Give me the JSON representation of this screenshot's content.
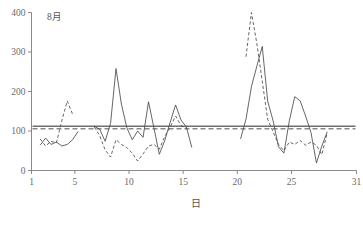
{
  "chart_data": {
    "type": "line",
    "title": "8月",
    "xlabel": "日",
    "ylabel": "",
    "xlim": [
      1,
      31
    ],
    "ylim": [
      0,
      400
    ],
    "xticks": [
      1,
      5,
      10,
      15,
      20,
      25,
      31
    ],
    "xticklabels": [
      "1",
      "5",
      "10",
      "15",
      "20",
      "25",
      "31"
    ],
    "yticks": [
      0,
      100,
      200,
      300,
      400
    ],
    "yticklabels": [
      "0",
      "100",
      "200",
      "300",
      "400"
    ],
    "grid": false,
    "legend": "none",
    "reference_lines": [
      {
        "name": "solid-reference",
        "value": 112,
        "style": "solid"
      },
      {
        "name": "dashed-reference",
        "value": 106,
        "style": "dashed"
      }
    ],
    "series": [
      {
        "name": "solid-series",
        "style": "solid",
        "segments": [
          {
            "x": [
              1.8,
              2.3,
              2.8,
              3.3,
              3.8,
              4.3,
              4.8,
              5.3
            ],
            "y": [
              64,
              82,
              66,
              72,
              62,
              66,
              78,
              99
            ]
          },
          {
            "x": [
              6.8,
              7.3,
              7.8,
              8.3,
              8.8,
              9.3,
              9.8,
              10.3,
              10.8,
              11.3,
              11.8,
              12.3,
              12.8,
              13.3,
              13.8,
              14.3,
              14.8,
              15.3,
              15.8
            ],
            "y": [
              112,
              104,
              74,
              120,
              258,
              168,
              108,
              78,
              100,
              84,
              174,
              108,
              41,
              76,
              122,
              166,
              128,
              110,
              58
            ]
          },
          {
            "x": [
              20.3,
              20.8,
              21.3,
              21.8,
              22.3,
              22.8,
              23.3,
              23.8,
              24.3,
              24.8,
              25.3,
              25.8,
              26.3,
              26.8,
              27.3,
              27.8,
              28.3
            ],
            "y": [
              80,
              130,
              212,
              264,
              314,
              176,
              126,
              60,
              44,
              126,
              187,
              176,
              138,
              96,
              19,
              62,
              98
            ]
          }
        ]
      },
      {
        "name": "dashed-series",
        "style": "dashed",
        "segments": [
          {
            "x": [
              1.8,
              2.3,
              2.8,
              3.3,
              3.8,
              4.3,
              4.8
            ],
            "y": [
              80,
              62,
              74,
              70,
              126,
              176,
              142
            ]
          },
          {
            "x": [
              6.8,
              7.3,
              7.8,
              8.3,
              8.8,
              9.3,
              9.8,
              10.3,
              10.8,
              11.3,
              11.8,
              12.3,
              12.8,
              13.3,
              13.8,
              14.3,
              14.8,
              15.3
            ],
            "y": [
              110,
              88,
              52,
              34,
              78,
              66,
              58,
              44,
              24,
              42,
              62,
              66,
              54,
              86,
              110,
              138,
              114,
              106
            ]
          },
          {
            "x": [
              20.8,
              21.3,
              21.8,
              22.3,
              22.8,
              23.3,
              23.8,
              24.3,
              24.8,
              25.3,
              25.8,
              26.3,
              26.8,
              27.3,
              27.8,
              28.3
            ],
            "y": [
              288,
              400,
              322,
              226,
              130,
              98,
              66,
              50,
              72,
              66,
              76,
              64,
              72,
              64,
              40,
              96
            ]
          }
        ]
      }
    ]
  },
  "axes": {
    "x_title": "日",
    "panel_label": "8月"
  }
}
